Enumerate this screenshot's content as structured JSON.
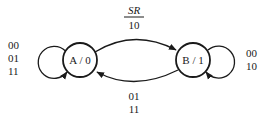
{
  "diagram": {
    "type": "state-diagram",
    "states": [
      {
        "id": "A",
        "label": "A / 0"
      },
      {
        "id": "B",
        "label": "B / 1"
      }
    ],
    "header_label": {
      "top": "SR",
      "bottom": "10"
    },
    "transitions": [
      {
        "from": "A",
        "to": "A",
        "labels": [
          "00",
          "01",
          "11"
        ]
      },
      {
        "from": "A",
        "to": "B",
        "labels": [
          "10"
        ]
      },
      {
        "from": "B",
        "to": "A",
        "labels": [
          "01",
          "11"
        ]
      },
      {
        "from": "B",
        "to": "B",
        "labels": [
          "00",
          "10"
        ]
      }
    ],
    "colors": {
      "stroke": "#1a1a1a",
      "background": "#ffffff"
    }
  }
}
